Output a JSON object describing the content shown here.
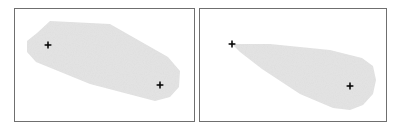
{
  "figure": {
    "width": 400,
    "height": 130,
    "background_color": "#ffffff",
    "panel_count": 2,
    "title": "",
    "caption": ""
  },
  "style": {
    "region_fill": "#e3e3e3",
    "region_fill_alt": "#e6e6e6",
    "frame_stroke": "#6f6f6f",
    "frame_fill": "#ffffff",
    "marker_color": "#111111",
    "marker_glyph": "plus-cross",
    "marker_arm_half_length": 3.4,
    "noise_opacity": 0.05
  },
  "chart_data": {
    "type": "scatter",
    "title": "",
    "xlabel": "",
    "ylabel": "",
    "grid": false,
    "legend": null,
    "panels": [
      {
        "id": "panel-left",
        "label": "",
        "frame": {
          "x": 14,
          "y": 8,
          "width": 180,
          "height": 113
        },
        "xlim": [
          14,
          194
        ],
        "ylim": [
          8,
          121
        ],
        "regions": [
          {
            "name": "convex-region-elongated",
            "shape": "convex-polygon",
            "fill": "#e3e3e3",
            "points": [
              [
                37,
                33
              ],
              [
                50,
                21
              ],
              [
                110,
                24
              ],
              [
                168,
                57
              ],
              [
                180,
                71
              ],
              [
                179,
                87
              ],
              [
                170,
                97
              ],
              [
                155,
                101
              ],
              [
                90,
                84
              ],
              [
                36,
                62
              ],
              [
                27,
                52
              ],
              [
                27,
                41
              ]
            ]
          }
        ],
        "markers": [
          {
            "name": "marker-a",
            "x": 48,
            "y": 45,
            "glyph": "plus-cross"
          },
          {
            "name": "marker-b",
            "x": 160,
            "y": 85,
            "glyph": "plus-cross"
          }
        ]
      },
      {
        "id": "panel-right",
        "label": "",
        "frame": {
          "x": 199,
          "y": 8,
          "width": 187,
          "height": 113
        },
        "xlim": [
          199,
          386
        ],
        "ylim": [
          8,
          121
        ],
        "regions": [
          {
            "name": "convex-region-wedge",
            "shape": "convex-polygon",
            "fill": "#e3e3e3",
            "points": [
              [
                232,
                44
              ],
              [
                270,
                44
              ],
              [
                330,
                50
              ],
              [
                362,
                58
              ],
              [
                373,
                66
              ],
              [
                376,
                80
              ],
              [
                373,
                94
              ],
              [
                363,
                105
              ],
              [
                350,
                110
              ],
              [
                333,
                108
              ],
              [
                300,
                94
              ],
              [
                262,
                69
              ],
              [
                240,
                52
              ]
            ]
          }
        ],
        "markers": [
          {
            "name": "marker-apex",
            "x": 232,
            "y": 44,
            "glyph": "plus-cross"
          },
          {
            "name": "marker-interior",
            "x": 350,
            "y": 86,
            "glyph": "plus-cross"
          }
        ]
      }
    ]
  }
}
